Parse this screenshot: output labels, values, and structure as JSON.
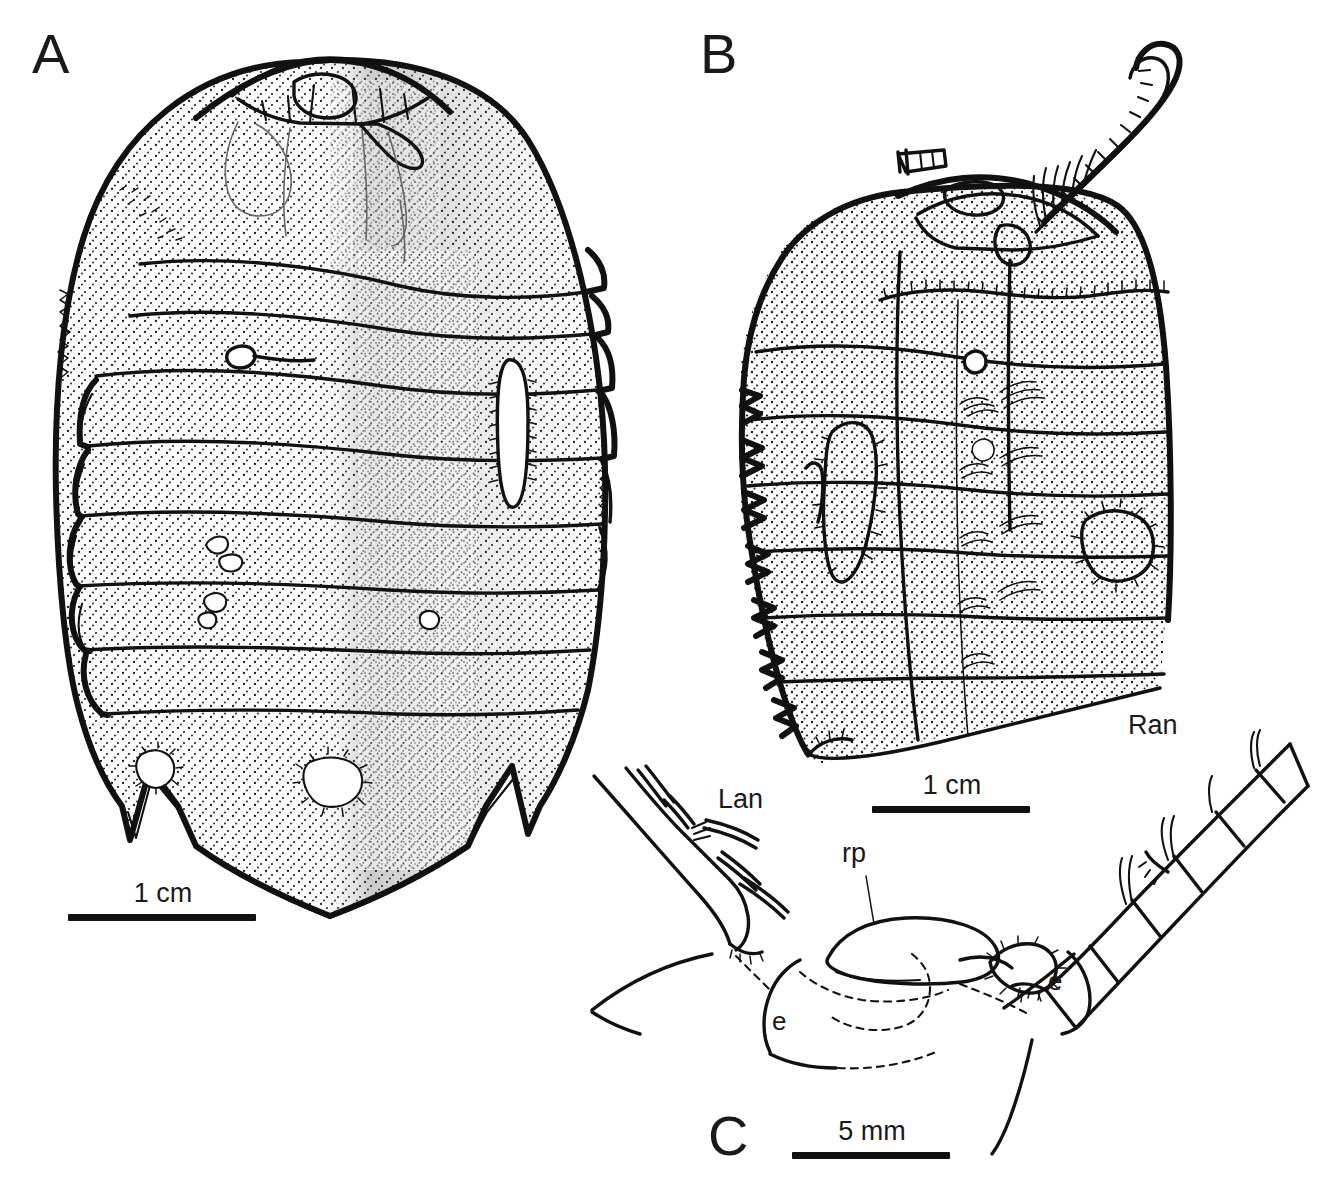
{
  "figure": {
    "background_color": "#ffffff",
    "ink_color": "#111111",
    "type": "scientific-line-drawing"
  },
  "panels": [
    {
      "id": "A",
      "label": "A",
      "description": "dorsal view of complete specimen, stippled shading, segmented thorax with pygidium bearing spines",
      "scale": {
        "label": "1 cm",
        "bar_length_px": 188
      }
    },
    {
      "id": "B",
      "label": "B",
      "description": "dorsal view of second specimen with preserved antenna and damaged margins",
      "scale": {
        "label": "1 cm",
        "bar_length_px": 158
      }
    },
    {
      "id": "C",
      "label": "C",
      "description": "detail of cephalic region showing antennae, rostral plate and eyes",
      "scale": {
        "label": "5 mm",
        "bar_length_px": 158
      }
    }
  ],
  "annotations": [
    {
      "text": "Lan",
      "meaning": "left antenna",
      "panel": "C"
    },
    {
      "text": "Ran",
      "meaning": "right antenna",
      "panel": "C"
    },
    {
      "text": "rp",
      "meaning": "rostral plate",
      "panel": "C"
    },
    {
      "text": "e",
      "meaning": "eye (left)",
      "panel": "C"
    },
    {
      "text": "e",
      "meaning": "eye (right)",
      "panel": "C"
    }
  ],
  "scale_bars": {
    "panel_a": "1 cm",
    "panel_b": "1 cm",
    "panel_c": "5 mm"
  }
}
